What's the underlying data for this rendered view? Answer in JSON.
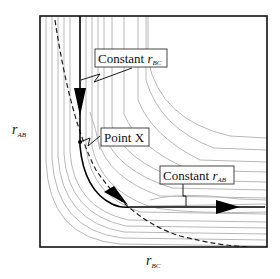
{
  "diagram": {
    "type": "potential energy surface contour plot",
    "axes": {
      "x_label": {
        "var": "r",
        "sub": "BC"
      },
      "y_label": {
        "var": "r",
        "sub": "AB"
      }
    },
    "annotations": [
      {
        "id": "const-rbc",
        "text": "Constant ",
        "var": "r",
        "sub": "BC"
      },
      {
        "id": "point-x",
        "text": "Point X"
      },
      {
        "id": "const-rab",
        "text": "Constant ",
        "var": "r",
        "sub": "AB"
      }
    ],
    "colors": {
      "frame": "#111111",
      "contour": "#b8b8b8",
      "path": "#000000",
      "dashed": "#222222"
    }
  }
}
